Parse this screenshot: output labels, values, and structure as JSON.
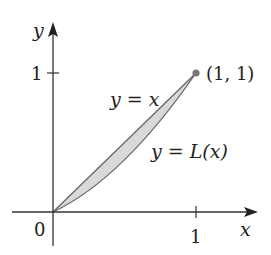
{
  "diagram": {
    "axes": {
      "x_label": "x",
      "y_label": "y",
      "origin_label": "0",
      "x_tick_label": "1",
      "y_tick_label": "1"
    },
    "curves": [
      {
        "name": "line-of-equality",
        "label": "y = x"
      },
      {
        "name": "lorenz-curve",
        "label": "y = L(x)"
      }
    ],
    "point": {
      "label": "(1, 1)"
    },
    "colors": {
      "axis": "#333333",
      "curve": "#666666",
      "fill": "#d9d9d9",
      "point": "#777777",
      "text": "#222222"
    }
  }
}
